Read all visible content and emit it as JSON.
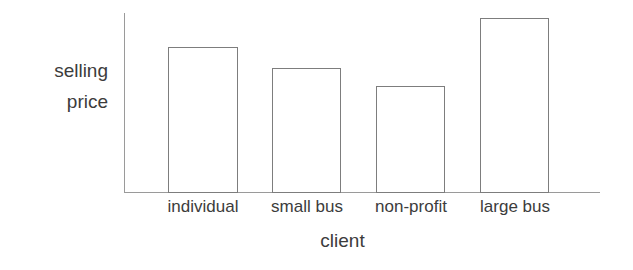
{
  "chart_data": {
    "type": "bar",
    "title": "",
    "xlabel": "client",
    "ylabel": "selling price",
    "ylabel_lines": [
      "selling",
      "price"
    ],
    "categories": [
      "individual",
      "small bus",
      "non-profit",
      "large bus"
    ],
    "values": [
      83,
      71,
      61,
      100
    ],
    "values_note": "relative bar heights in percent of tallest bar; axis is unlabeled/unscaled",
    "ylim": [
      0,
      103
    ],
    "grid": false,
    "legend": null,
    "annotations": [],
    "bar_style": {
      "fill": "none",
      "edge_color": "#7d7d7d",
      "edge_width_px": 1
    },
    "axis_color": "#9a9a9a",
    "text_color": "#3c3c3c",
    "background": "#ffffff"
  },
  "geometry": {
    "bars": [
      {
        "left_px": 168,
        "width_px": 70,
        "top_px": 47,
        "height_px": 146
      },
      {
        "left_px": 272,
        "width_px": 69,
        "top_px": 68,
        "height_px": 125
      },
      {
        "left_px": 376,
        "width_px": 69,
        "top_px": 86,
        "height_px": 107
      },
      {
        "left_px": 480,
        "width_px": 69,
        "top_px": 18,
        "height_px": 175
      }
    ],
    "tick_label_boxes": [
      {
        "left_px": 153,
        "width_px": 100
      },
      {
        "left_px": 257,
        "width_px": 100
      },
      {
        "left_px": 361,
        "width_px": 100
      },
      {
        "left_px": 465,
        "width_px": 100
      }
    ]
  }
}
